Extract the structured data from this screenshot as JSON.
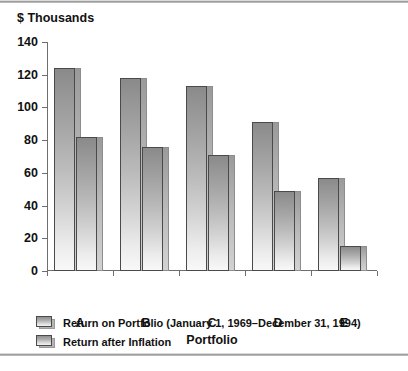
{
  "figure": {
    "y_axis_title": "$ Thousands",
    "x_axis_title": "Portfolio"
  },
  "legend": {
    "items": [
      {
        "label": "Return on Portfolio (January 1, 1969–December 31, 1994)",
        "swatch": "legend-swatch-series-1"
      },
      {
        "label": "Return after Inflation",
        "swatch": "legend-swatch-series-2"
      }
    ]
  },
  "chart_data": {
    "type": "bar",
    "title": "",
    "subtitle": "",
    "xlabel": "Portfolio",
    "ylabel": "$ Thousands",
    "categories": [
      "A",
      "B",
      "C",
      "D",
      "E"
    ],
    "series": [
      {
        "name": "Return on Portfolio (January 1, 1969–December 31, 1994)",
        "values": [
          124,
          118,
          113,
          91,
          57
        ]
      },
      {
        "name": "Return after Inflation",
        "values": [
          82,
          76,
          71,
          49,
          15
        ]
      }
    ],
    "ylim": [
      0,
      140
    ],
    "yticks": [
      0,
      20,
      40,
      60,
      80,
      100,
      120,
      140
    ],
    "ytick_labels": [
      "0",
      "20",
      "40",
      "60",
      "80",
      "100",
      "120",
      "140"
    ],
    "grid": false,
    "legend_position": "below",
    "bar_style": "drop-shadow-3d-gradient",
    "colors": {
      "bar_top": "#8a8a8a",
      "bar_bottom": "#f8f8f8",
      "bar_border": "#4a4a4a",
      "bar_shadow": "#b5b5b5",
      "axis": "#6e6e6e",
      "text": "#111111",
      "background": "#ffffff"
    }
  }
}
